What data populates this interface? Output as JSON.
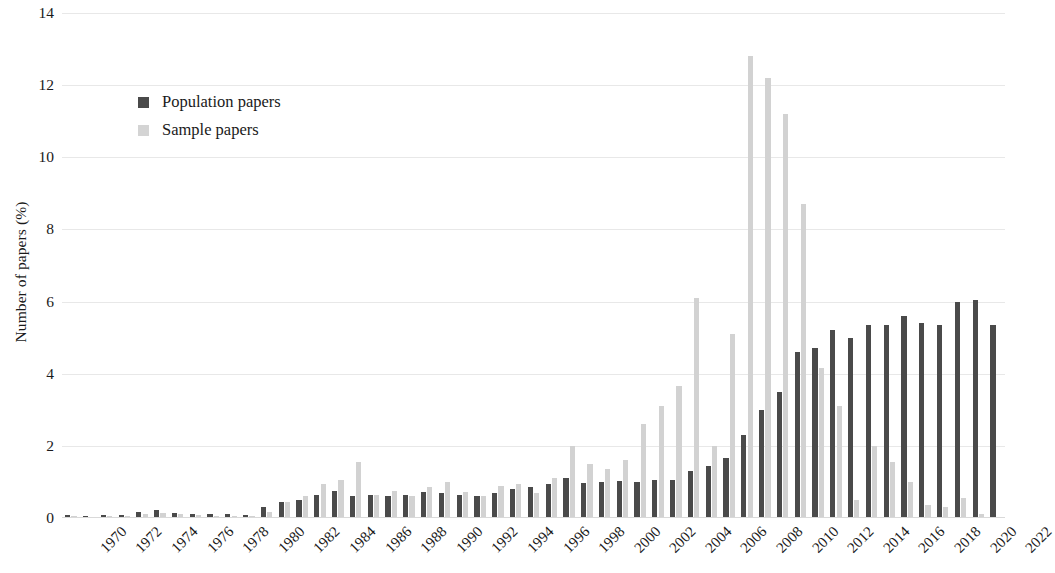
{
  "chart_data": {
    "type": "bar",
    "title": "",
    "subtitle": "",
    "xlabel": "",
    "ylabel": "Number of papers (%)",
    "ylim": [
      0,
      14
    ],
    "ytick_step": 2,
    "yticks": [
      14,
      12,
      10,
      8,
      6,
      4,
      2,
      0
    ],
    "grid": true,
    "grid_axis": "y",
    "legend_position": "upper-left-inside",
    "xtick_step": 2,
    "xtick_rotation": -45,
    "categories": [
      1970,
      1971,
      1972,
      1973,
      1974,
      1975,
      1976,
      1977,
      1978,
      1979,
      1980,
      1981,
      1982,
      1983,
      1984,
      1985,
      1986,
      1987,
      1988,
      1989,
      1990,
      1991,
      1992,
      1993,
      1994,
      1995,
      1996,
      1997,
      1998,
      1999,
      2000,
      2001,
      2002,
      2003,
      2004,
      2005,
      2006,
      2007,
      2008,
      2009,
      2010,
      2011,
      2012,
      2013,
      2014,
      2015,
      2016,
      2017,
      2018,
      2019,
      2020,
      2021,
      2022
    ],
    "xtick_labels": [
      "1970",
      "1972",
      "1974",
      "1976",
      "1978",
      "1980",
      "1982",
      "1984",
      "1986",
      "1988",
      "1990",
      "1992",
      "1994",
      "1996",
      "1998",
      "2000",
      "2002",
      "2004",
      "2006",
      "2008",
      "2010",
      "2012",
      "2014",
      "2016",
      "2018",
      "2020",
      "2022"
    ],
    "series": [
      {
        "name": "Population papers",
        "color": "#4a4a4a",
        "values": [
          0.08,
          0.06,
          0.08,
          0.07,
          0.18,
          0.22,
          0.15,
          0.12,
          0.1,
          0.1,
          0.08,
          0.3,
          0.45,
          0.5,
          0.65,
          0.75,
          0.62,
          0.65,
          0.6,
          0.65,
          0.72,
          0.7,
          0.65,
          0.6,
          0.7,
          0.8,
          0.85,
          0.95,
          1.1,
          0.98,
          1.0,
          1.02,
          1.0,
          1.05,
          1.05,
          1.3,
          1.45,
          1.65,
          2.3,
          3.0,
          3.5,
          4.6,
          4.7,
          5.2,
          5.0,
          5.35,
          5.35,
          5.6,
          5.4,
          5.35,
          6.0,
          6.05,
          5.35
        ]
      },
      {
        "name": "Sample papers",
        "color": "#d2d2d2",
        "values": [
          0.05,
          0.04,
          0.05,
          0.05,
          0.12,
          0.14,
          0.1,
          0.08,
          0.06,
          0.06,
          0.05,
          0.18,
          0.45,
          0.6,
          0.95,
          1.05,
          1.55,
          0.65,
          0.75,
          0.6,
          0.85,
          1.0,
          0.72,
          0.6,
          0.9,
          0.95,
          0.7,
          1.1,
          2.0,
          1.5,
          1.35,
          1.6,
          2.6,
          3.1,
          3.65,
          6.1,
          2.0,
          5.1,
          12.8,
          12.2,
          11.2,
          8.7,
          4.15,
          3.1,
          0.5,
          2.0,
          1.55,
          1.0,
          0.35,
          0.3,
          0.55,
          0.12,
          0.0
        ]
      }
    ]
  },
  "legend": {
    "items": [
      {
        "label": "Population papers",
        "swatch": "population"
      },
      {
        "label": "Sample papers",
        "swatch": "sample"
      }
    ]
  }
}
